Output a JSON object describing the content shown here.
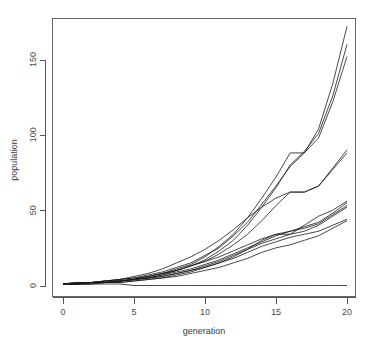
{
  "figure": {
    "title_cropped": "Population growth simulation replicates",
    "background": "#ffffff",
    "line_color": "#1a1a1a",
    "axis_color": "#555555"
  },
  "chart_data": {
    "type": "line",
    "title": "Population growth simulation replicates",
    "xlabel": "generation",
    "ylabel": "population",
    "xlim": [
      0,
      20
    ],
    "ylim": [
      0,
      180
    ],
    "xticks": [
      0,
      5,
      10,
      15,
      20
    ],
    "yticks": [
      0,
      50,
      100,
      150
    ],
    "xticklabels": [
      "0",
      "5",
      "10",
      "15",
      "20"
    ],
    "yticklabels": [
      "0",
      "50",
      "100",
      "150"
    ],
    "grid": false,
    "legend": "none",
    "x": [
      0,
      1,
      2,
      3,
      4,
      5,
      6,
      7,
      8,
      9,
      10,
      11,
      12,
      13,
      14,
      15,
      16,
      17,
      18,
      19,
      20
    ],
    "series": [
      {
        "name": "run-01",
        "values": [
          1,
          1,
          2,
          2,
          3,
          4,
          6,
          8,
          11,
          14,
          19,
          26,
          34,
          45,
          58,
          72,
          88,
          88,
          104,
          134,
          172
        ]
      },
      {
        "name": "run-02",
        "values": [
          1,
          1,
          2,
          2,
          3,
          4,
          5,
          7,
          10,
          13,
          17,
          23,
          30,
          40,
          52,
          65,
          80,
          89,
          101,
          126,
          160
        ]
      },
      {
        "name": "run-03",
        "values": [
          1,
          2,
          2,
          3,
          4,
          5,
          7,
          9,
          12,
          15,
          20,
          25,
          33,
          42,
          54,
          66,
          79,
          88,
          98,
          122,
          152
        ]
      },
      {
        "name": "run-04",
        "values": [
          1,
          1,
          1,
          2,
          3,
          4,
          6,
          8,
          10,
          13,
          16,
          21,
          27,
          34,
          43,
          53,
          62,
          62,
          66,
          78,
          90
        ]
      },
      {
        "name": "run-05",
        "values": [
          1,
          1,
          2,
          3,
          4,
          6,
          8,
          11,
          15,
          19,
          24,
          30,
          37,
          45,
          52,
          58,
          62,
          62,
          66,
          77,
          88
        ]
      },
      {
        "name": "run-06",
        "values": [
          1,
          1,
          2,
          2,
          2,
          3,
          4,
          5,
          7,
          9,
          12,
          15,
          19,
          24,
          30,
          34,
          34,
          40,
          46,
          50,
          56
        ]
      },
      {
        "name": "run-07",
        "values": [
          1,
          2,
          2,
          3,
          3,
          4,
          5,
          6,
          8,
          10,
          13,
          16,
          20,
          24,
          28,
          31,
          34,
          36,
          40,
          46,
          52
        ]
      },
      {
        "name": "run-08",
        "values": [
          1,
          1,
          2,
          2,
          3,
          4,
          5,
          6,
          8,
          10,
          12,
          15,
          18,
          22,
          26,
          29,
          32,
          34,
          36,
          40,
          44
        ]
      },
      {
        "name": "run-09",
        "values": [
          1,
          1,
          1,
          2,
          2,
          3,
          4,
          5,
          6,
          8,
          10,
          12,
          15,
          18,
          22,
          25,
          27,
          30,
          33,
          38,
          43
        ]
      },
      {
        "name": "run-10",
        "values": [
          1,
          1,
          2,
          2,
          3,
          4,
          5,
          7,
          9,
          11,
          14,
          17,
          21,
          25,
          29,
          33,
          36,
          38,
          41,
          47,
          53
        ]
      },
      {
        "name": "run-11",
        "values": [
          1,
          2,
          2,
          3,
          4,
          5,
          6,
          8,
          10,
          13,
          16,
          19,
          23,
          27,
          31,
          34,
          36,
          39,
          42,
          48,
          55
        ]
      },
      {
        "name": "run-12",
        "values": [
          1,
          1,
          1,
          1,
          1,
          0,
          0,
          0,
          0,
          0,
          0,
          0,
          0,
          0,
          0,
          0,
          0,
          0,
          0,
          0,
          0
        ]
      }
    ]
  }
}
